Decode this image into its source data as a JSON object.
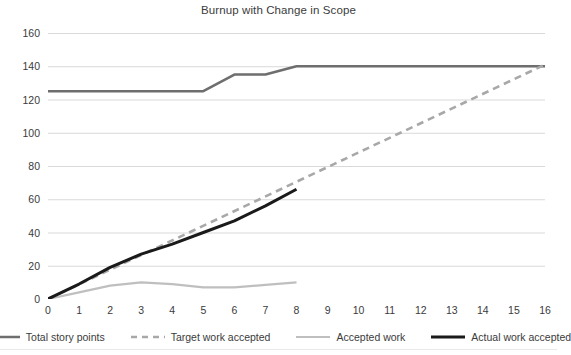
{
  "chart_data": {
    "type": "line",
    "title": "Burnup with Change in Scope",
    "xlabel": "",
    "ylabel": "",
    "xlim": [
      0,
      16
    ],
    "ylim": [
      0,
      160
    ],
    "grid": true,
    "grid_color": "#d9d9d9",
    "legend_position": "bottom",
    "x_ticks": [
      "0",
      "1",
      "2",
      "3",
      "4",
      "5",
      "6",
      "7",
      "8",
      "9",
      "10",
      "11",
      "12",
      "13",
      "14",
      "15",
      "16"
    ],
    "y_ticks": [
      "0",
      "20",
      "40",
      "60",
      "80",
      "100",
      "120",
      "140",
      "160"
    ],
    "series": [
      {
        "name": "Total story points",
        "color": "#6e6e6e",
        "style": "solid",
        "width": 2.6,
        "x": [
          0,
          1,
          2,
          3,
          4,
          5,
          6,
          7,
          8,
          9,
          10,
          11,
          12,
          13,
          14,
          15,
          16
        ],
        "values": [
          125,
          125,
          125,
          125,
          125,
          125,
          135,
          135,
          140,
          140,
          140,
          140,
          140,
          140,
          140,
          140,
          140
        ]
      },
      {
        "name": "Target work accepted",
        "color": "#a8a8a8",
        "style": "dashed",
        "width": 2.6,
        "x": [
          0,
          16
        ],
        "values": [
          0,
          141
        ]
      },
      {
        "name": "Accepted work",
        "color": "#bfbfbf",
        "style": "solid",
        "width": 2.2,
        "x": [
          0,
          1,
          2,
          3,
          4,
          5,
          6,
          7,
          8
        ],
        "values": [
          0,
          4,
          8,
          10,
          9,
          7,
          7,
          8.5,
          10
        ]
      },
      {
        "name": "Actual work accepted",
        "color": "#1a1a1a",
        "style": "solid",
        "width": 3.0,
        "x": [
          0,
          1,
          2,
          3,
          4,
          5,
          6,
          7,
          8
        ],
        "values": [
          0,
          9,
          19,
          27,
          33,
          40,
          47,
          56,
          66
        ]
      }
    ]
  },
  "legend": {
    "items": [
      {
        "label": "Total story points"
      },
      {
        "label": "Target work accepted"
      },
      {
        "label": "Accepted work"
      },
      {
        "label": "Actual work accepted"
      }
    ]
  }
}
